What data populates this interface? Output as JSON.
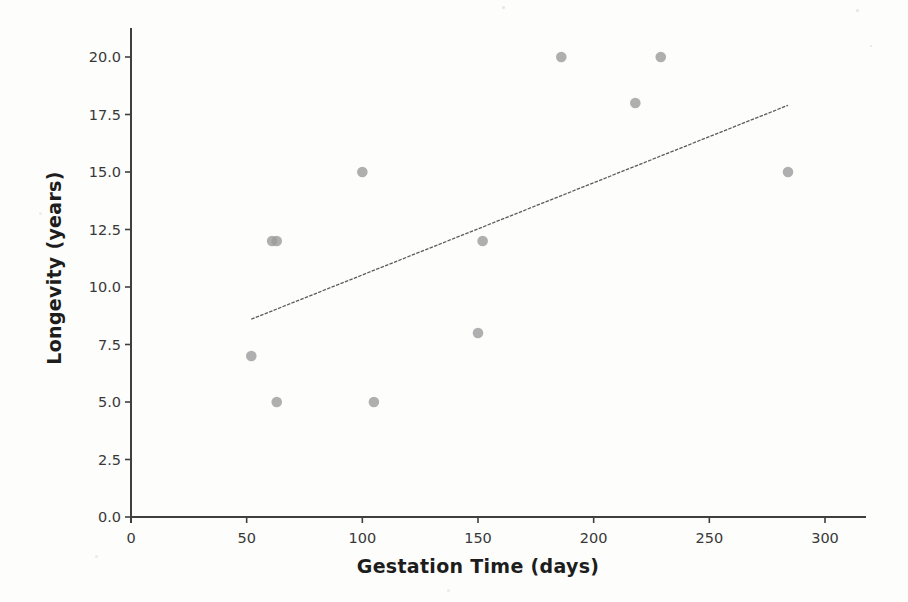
{
  "chart_data": {
    "type": "scatter",
    "title": "",
    "xlabel": "Gestation Time (days)",
    "ylabel": "Longevity (years)",
    "xlim": [
      0,
      318
    ],
    "ylim": [
      0,
      21.3
    ],
    "grid": false,
    "legend": null,
    "x_tick_values": [
      0,
      50,
      100,
      150,
      200,
      250,
      300
    ],
    "x_tick_labels": [
      "0",
      "50",
      "100",
      "150",
      "200",
      "250",
      "300"
    ],
    "y_tick_values": [
      0,
      2.5,
      5,
      7.5,
      10,
      12.5,
      15,
      17.5,
      20
    ],
    "y_tick_labels": [
      "0.0",
      "2.5",
      "5.0",
      "7.5",
      "10.0",
      "12.5",
      "15.0",
      "17.5",
      "20.0"
    ],
    "series": [
      {
        "name": "animals",
        "marker": "circle",
        "color": "#9b9b9b",
        "points": [
          {
            "x": 52,
            "y": 7
          },
          {
            "x": 61,
            "y": 12
          },
          {
            "x": 63,
            "y": 12
          },
          {
            "x": 63,
            "y": 5
          },
          {
            "x": 100,
            "y": 15
          },
          {
            "x": 105,
            "y": 5
          },
          {
            "x": 150,
            "y": 8
          },
          {
            "x": 152,
            "y": 12
          },
          {
            "x": 186,
            "y": 20
          },
          {
            "x": 218,
            "y": 18
          },
          {
            "x": 229,
            "y": 20
          },
          {
            "x": 284,
            "y": 15
          }
        ]
      }
    ],
    "trend_line": {
      "x1": 52,
      "y1": 8.6,
      "x2": 284,
      "y2": 17.9,
      "color": "#5c5c5c",
      "style": "dashed-scan"
    }
  }
}
